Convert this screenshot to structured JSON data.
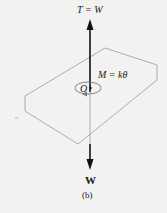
{
  "figure": {
    "caption": "(b)",
    "labels": {
      "tension": "T = W",
      "moment": "M = kθ",
      "origin": "O",
      "weight": "W"
    },
    "colors": {
      "background": "#f2f2f0",
      "arrow": "#111111",
      "plate_outline": "#9a9a9a",
      "text": "#1a1a1a"
    },
    "elements": [
      {
        "type": "arrow",
        "name": "tension-arrow",
        "direction": "up",
        "label": "T = W"
      },
      {
        "type": "arrow",
        "name": "weight-arrow",
        "direction": "down",
        "label": "W"
      },
      {
        "type": "plate",
        "name": "plate",
        "shape": "hexagonal plate in perspective"
      },
      {
        "type": "moment-circle",
        "name": "moment-arrow",
        "label": "M = kθ",
        "center": "O"
      }
    ]
  }
}
